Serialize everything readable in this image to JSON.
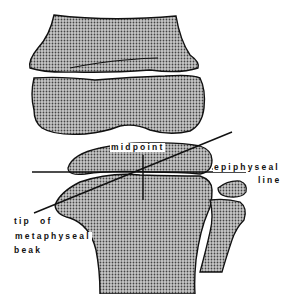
{
  "figure": {
    "type": "anatomical line diagram",
    "fill_color": "#9a9a9a",
    "stroke_color": "#111111"
  },
  "labels": {
    "midpoint": "midpoint",
    "epiphyseal_line_1": "epiphyseal",
    "epiphyseal_line_2": "line",
    "tip_1": "tip  of",
    "tip_2": "metaphyseal",
    "tip_3": "beak"
  },
  "structures": [
    {
      "name": "femur-diaphysis",
      "description": "upper bone"
    },
    {
      "name": "femoral-epiphysis",
      "description": "distal femoral epiphysis"
    },
    {
      "name": "tibial-epiphysis",
      "description": "proximal tibial epiphysis"
    },
    {
      "name": "tibial-metaphysis",
      "description": "tibia with metaphyseal beak"
    },
    {
      "name": "fibula",
      "description": "fibula with epiphysis"
    }
  ],
  "lines": [
    {
      "name": "epiphyseal-line",
      "description": "horizontal line through epiphyseal plate"
    },
    {
      "name": "oblique-line",
      "description": "line from tip of metaphyseal beak through midpoint"
    },
    {
      "name": "midpoint-perpendicular",
      "description": "vertical line at midpoint"
    }
  ]
}
